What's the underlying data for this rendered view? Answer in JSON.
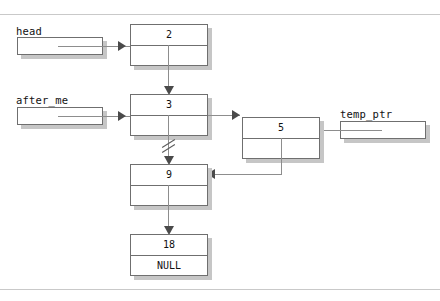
{
  "figure": {
    "border_color": "#c9c9c9",
    "line_color": "#8d8d8d",
    "box_border_color": "#6f6f6f",
    "shadow_color": "#c6c6c6",
    "arrow_color": "#4a4a4a"
  },
  "pointers": [
    {
      "id": "head",
      "label": "head"
    },
    {
      "id": "after_me",
      "label": "after_me"
    },
    {
      "id": "temp_ptr",
      "label": "temp_ptr"
    }
  ],
  "nodes": [
    {
      "id": "n2",
      "value": "2",
      "next_text": ""
    },
    {
      "id": "n3",
      "value": "3",
      "next_text": ""
    },
    {
      "id": "n5",
      "value": "5",
      "next_text": ""
    },
    {
      "id": "n9",
      "value": "9",
      "next_text": ""
    },
    {
      "id": "n18",
      "value": "18",
      "next_text": "NULL"
    }
  ],
  "edges": [
    {
      "id": "head-to-2",
      "from": "head",
      "to": "n2",
      "style": "solid",
      "severed": false
    },
    {
      "id": "after_me-to-3",
      "from": "after_me",
      "to": "n3",
      "style": "solid",
      "severed": false
    },
    {
      "id": "temp_ptr-to-5",
      "from": "temp_ptr",
      "to": "n5",
      "style": "solid",
      "severed": false
    },
    {
      "id": "n2-to-n3",
      "from": "n2",
      "to": "n3",
      "style": "solid",
      "severed": false
    },
    {
      "id": "n3-to-n5",
      "from": "n3",
      "to": "n5",
      "style": "solid",
      "severed": false
    },
    {
      "id": "n3-to-n9",
      "from": "n3",
      "to": "n9",
      "style": "solid",
      "severed": true
    },
    {
      "id": "n5-to-n9",
      "from": "n5",
      "to": "n9",
      "style": "solid",
      "severed": false
    },
    {
      "id": "n9-to-n18",
      "from": "n9",
      "to": "n18",
      "style": "solid",
      "severed": false
    }
  ]
}
